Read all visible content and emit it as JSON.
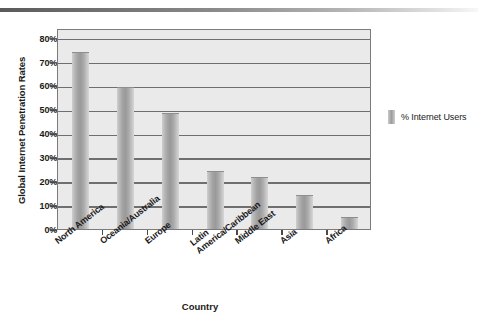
{
  "chart_data": {
    "type": "bar",
    "title": "",
    "xlabel": "Country",
    "ylabel": "Global Internet Penetration Rates",
    "categories": [
      "North America",
      "Oceania/Australia",
      "Europe",
      "Latin America/Caribbean",
      "Middle East",
      "Asia",
      "Africa"
    ],
    "category_lines": [
      [
        "North America"
      ],
      [
        "Oceania/Australia"
      ],
      [
        "Europe"
      ],
      [
        "Latin",
        "America/Caribbean"
      ],
      [
        "Middle East"
      ],
      [
        "Asia"
      ],
      [
        "Africa"
      ]
    ],
    "values": [
      73.5,
      59,
      48,
      24,
      21.5,
      14,
      4.5
    ],
    "series": [
      {
        "name": "% Internet Users",
        "values": [
          73.5,
          59,
          48,
          24,
          21.5,
          14,
          4.5
        ]
      }
    ],
    "ylim": [
      0,
      84
    ],
    "ytick_values": [
      0,
      10,
      20,
      30,
      40,
      50,
      60,
      70,
      80
    ],
    "ytick_labels": [
      "0%",
      "10%",
      "20%",
      "30%",
      "40%",
      "50%",
      "60%",
      "70%",
      "80%"
    ],
    "grid": true,
    "legend": {
      "position": "right",
      "entries": [
        "% Internet Users"
      ]
    },
    "colors": {
      "bar": "#9a9a9a",
      "plot_background": "#eaeaea",
      "gridline": "#6f6f6f",
      "border": "#7b7b7b",
      "text": "#1a1a1a"
    }
  },
  "legend": {
    "label": "% Internet Users"
  },
  "axes": {
    "y_title": "Global Internet Penetration Rates",
    "x_title": "Country"
  }
}
